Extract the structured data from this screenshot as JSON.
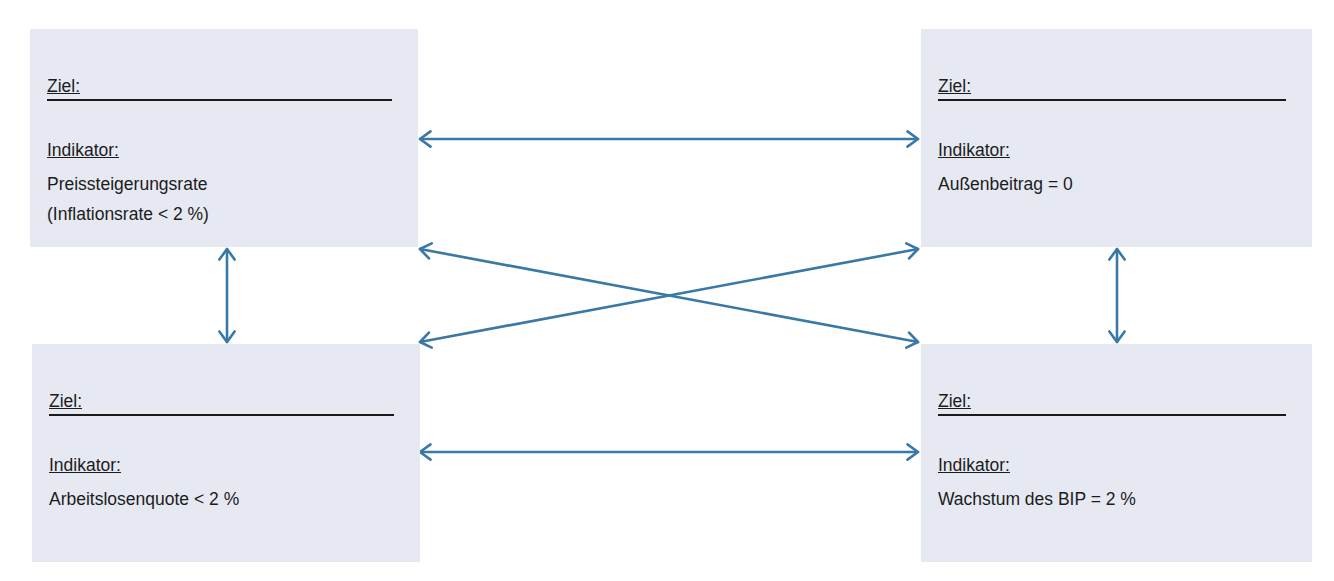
{
  "diagram": {
    "type": "goal-relationship-diagram",
    "arrow_color": "#3a79a6",
    "box_fill": "#e6e9f2",
    "boxes": [
      {
        "id": "tl",
        "goal_label": "Ziel:",
        "goal_value": "",
        "indicator_label": "Indikator:",
        "indicator_value": "Preissteigerungsrate\n(Inflationsrate < 2 %)"
      },
      {
        "id": "tr",
        "goal_label": "Ziel:",
        "goal_value": "",
        "indicator_label": "Indikator:",
        "indicator_value": "Außenbeitrag = 0"
      },
      {
        "id": "bl",
        "goal_label": "Ziel:",
        "goal_value": "",
        "indicator_label": "Indikator:",
        "indicator_value": "Arbeitslosenquote < 2 %"
      },
      {
        "id": "br",
        "goal_label": "Ziel:",
        "goal_value": "",
        "indicator_label": "Indikator:",
        "indicator_value": "Wachstum des BIP = 2 %"
      }
    ],
    "connections": [
      {
        "from": "tl",
        "to": "tr",
        "style": "double-arrow",
        "x1": 420,
        "y1": 139,
        "x2": 918,
        "y2": 139
      },
      {
        "from": "bl",
        "to": "br",
        "style": "double-arrow",
        "x1": 420,
        "y1": 452,
        "x2": 918,
        "y2": 452
      },
      {
        "from": "tl",
        "to": "bl",
        "style": "double-arrow",
        "x1": 227,
        "y1": 249,
        "x2": 227,
        "y2": 342
      },
      {
        "from": "tr",
        "to": "br",
        "style": "double-arrow",
        "x1": 1117,
        "y1": 249,
        "x2": 1117,
        "y2": 342
      },
      {
        "from": "tl",
        "to": "br",
        "style": "double-arrow",
        "x1": 420,
        "y1": 249,
        "x2": 918,
        "y2": 342
      },
      {
        "from": "bl",
        "to": "tr",
        "style": "double-arrow",
        "x1": 420,
        "y1": 342,
        "x2": 918,
        "y2": 249
      }
    ]
  }
}
